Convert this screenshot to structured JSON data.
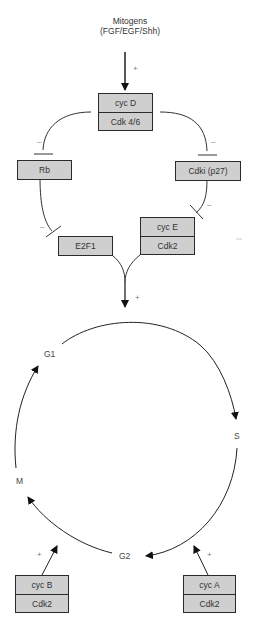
{
  "diagram": {
    "input": {
      "line1": "Mitogens",
      "line2": "(FGF/EGF/Shh)",
      "effect": "+"
    },
    "nodes": {
      "cycD": {
        "top": "cyc D",
        "bottom": "Cdk 4/6"
      },
      "rb": {
        "label": "Rb"
      },
      "cdki": {
        "label": "Cdki (p27)"
      },
      "e2f1": {
        "label": "E2F1"
      },
      "cycE": {
        "top": "cyc E",
        "bottom": "Cdk2"
      },
      "cycB": {
        "top": "cyc B",
        "bottom": "Cdk2"
      },
      "cycA": {
        "top": "cyc A",
        "bottom": "Cdk2"
      }
    },
    "edges": [
      {
        "from": "Mitogens",
        "to": "cyc D/Cdk 4/6",
        "sign": "+"
      },
      {
        "from": "cyc D/Cdk 4/6",
        "to": "Rb",
        "sign": "–"
      },
      {
        "from": "cyc D/Cdk 4/6",
        "to": "Cdki (p27)",
        "sign": "–"
      },
      {
        "from": "Rb",
        "to": "E2F1",
        "sign": "–"
      },
      {
        "from": "Cdki (p27)",
        "to": "cyc E/Cdk2",
        "sign": "–"
      },
      {
        "from": "E2F1 + cyc E/Cdk2",
        "to": "G1/S",
        "sign": "+"
      },
      {
        "from": "cyc B/Cdk2",
        "to": "G2→M",
        "sign": "+"
      },
      {
        "from": "cyc A/Cdk2",
        "to": "S→G2",
        "sign": "+"
      }
    ],
    "signs": {
      "mitogen": "+",
      "rb_inhib": "–",
      "cdki_inhib": "–",
      "e2f1_inhib": "–",
      "cyce_inhib": "–",
      "merge": "+",
      "cycB": "+",
      "cycA": "+"
    },
    "cycle": {
      "phases": [
        "G1",
        "S",
        "G2",
        "M"
      ],
      "g1": "G1",
      "s": "S",
      "g2": "G2",
      "m": "M"
    }
  }
}
